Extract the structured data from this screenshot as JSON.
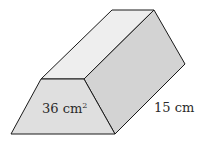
{
  "diagram": {
    "type": "trapezoidal-prism",
    "labels": {
      "cross_section_area": "36 cm",
      "cross_section_area_exp": "2",
      "length": "15 cm"
    },
    "colors": {
      "front_face": "#dedede",
      "top_face": "#eeeeee",
      "side_face": "#d2d2d2",
      "edge": "#1a1a1a"
    }
  }
}
